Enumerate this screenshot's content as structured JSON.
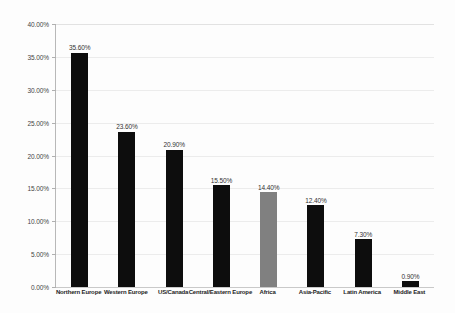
{
  "chart_data": {
    "type": "bar",
    "title": "",
    "subtitle": "",
    "xlabel": "",
    "ylabel": "",
    "ylim": [
      0,
      40
    ],
    "ytick_labels": [
      "0.00%",
      "5.00%",
      "10.00%",
      "15.00%",
      "20.00%",
      "25.00%",
      "30.00%",
      "35.00%",
      "40.00%"
    ],
    "ytick_values": [
      0,
      5,
      10,
      15,
      20,
      25,
      30,
      35,
      40
    ],
    "grid": true,
    "legend": "none",
    "categories": [
      "Northern Europe",
      "Western Europe",
      "US/Canada",
      "Central/Eastern Europe",
      "Africa",
      "Asia-Pacific",
      "Latin America",
      "Middle East"
    ],
    "values": [
      35.6,
      23.6,
      20.9,
      15.5,
      14.4,
      12.4,
      7.3,
      0.9
    ],
    "value_labels": [
      "35.60%",
      "23.60%",
      "20.90%",
      "15.50%",
      "14.40%",
      "12.40%",
      "7.30%",
      "0.90%"
    ],
    "bar_colors": [
      "#0d0d0d",
      "#0d0d0d",
      "#0d0d0d",
      "#0d0d0d",
      "#808080",
      "#0d0d0d",
      "#0d0d0d",
      "#0d0d0d"
    ],
    "highlight_index": 4,
    "colors": {
      "bar_default": "#0d0d0d",
      "bar_highlight": "#808080",
      "gridline": "#ececec",
      "axis": "#b8b8b8",
      "background": "#fdfdfd",
      "text": "#333333"
    }
  }
}
